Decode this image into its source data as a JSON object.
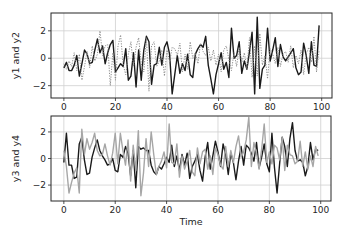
{
  "chart_data": [
    {
      "type": "line",
      "panel": "top",
      "title": "",
      "xlabel": "",
      "ylabel": "y1 and y2",
      "xlim": [
        -5,
        104
      ],
      "ylim": [
        -2.9,
        3.3
      ],
      "grid": true,
      "legend": null,
      "xticks": [
        0,
        20,
        40,
        60,
        80,
        100
      ],
      "yticks": [
        -2,
        0,
        2
      ],
      "xtick_labels": [
        "0",
        "20",
        "40",
        "60",
        "80",
        "100"
      ],
      "ytick_labels": [
        "−2",
        "0",
        "2"
      ],
      "series": [
        {
          "name": "y1",
          "style": "solid",
          "color": "#1a1a1a",
          "values": [
            -0.7,
            -0.3,
            -0.9,
            -0.9,
            -0.5,
            0.2,
            -1.3,
            -0.4,
            0.6,
            0.3,
            -0.4,
            -0.3,
            0.6,
            1.4,
            0.4,
            0.9,
            -0.4,
            0.4,
            1.0,
            1.3,
            -1.0,
            -0.7,
            -0.4,
            -0.6,
            0.7,
            -1.6,
            -1.3,
            0.4,
            -2.1,
            0.6,
            -1.6,
            0.6,
            1.6,
            1.2,
            -1.9,
            -0.5,
            -0.4,
            0.8,
            -0.5,
            0.8,
            1.2,
            0.3,
            -2.6,
            -1.2,
            0.2,
            -1.1,
            -0.4,
            -0.9,
            0.3,
            -1.2,
            -1.4,
            0.3,
            0.7,
            1.0,
            0.8,
            1.6,
            -0.5,
            -1.5,
            -2.6,
            -1.2,
            -0.4,
            0.4,
            -0.8,
            -0.3,
            -1.4,
            2.2,
            0.0,
            0.2,
            1.2,
            -1.1,
            -0.2,
            -0.8,
            0.5,
            1.9,
            -2.6,
            3.0,
            -2.2,
            -0.8,
            -0.5,
            2.2,
            -0.2,
            0.6,
            1.5,
            -0.6,
            1.0,
            0.1,
            -0.2,
            0.1,
            0.4,
            0.7,
            -0.7,
            -1.2,
            -1.0,
            1.1,
            0.2,
            -1.1,
            1.2,
            -0.5,
            -0.6,
            2.4
          ]
        },
        {
          "name": "y2",
          "style": "dotted",
          "color": "#8c8c8c",
          "values": [
            -0.4,
            -0.8,
            -0.2,
            -0.6,
            0.4,
            -0.9,
            0.3,
            -1.6,
            -0.6,
            0.5,
            -0.7,
            0.9,
            -0.2,
            0.3,
            2.0,
            0.2,
            0.9,
            1.0,
            -2.0,
            0.4,
            -1.6,
            0.9,
            1.7,
            -0.5,
            -1.2,
            0.3,
            1.2,
            -0.6,
            0.8,
            1.5,
            -0.4,
            -1.0,
            1.5,
            -2.4,
            0.9,
            1.2,
            -0.6,
            -0.2,
            0.6,
            -1.3,
            0.6,
            -0.3,
            0.8,
            0.7,
            0.2,
            1.1,
            -1.0,
            0.3,
            -0.8,
            1.2,
            0.0,
            0.4,
            -0.4,
            1.1,
            0.5,
            0.2,
            0.8,
            -0.2,
            0.6,
            -0.5,
            0.3,
            -1.0,
            0.6,
            0.9,
            -0.1,
            -0.9,
            0.4,
            -0.6,
            0.8,
            -0.3,
            0.4,
            -0.8,
            1.5,
            -1.4,
            0.9,
            -1.3,
            1.8,
            -0.5,
            0.2,
            -1.5,
            0.7,
            0.3,
            -0.4,
            0.8,
            -0.6,
            0.3,
            0.5,
            -0.3,
            0.9,
            -0.7,
            0.2,
            -0.4,
            0.6,
            -1.2,
            0.3,
            0.8,
            -0.3,
            1.6,
            -1.0,
            0.6
          ]
        }
      ]
    },
    {
      "type": "line",
      "panel": "bottom",
      "title": "",
      "xlabel": "Time",
      "ylabel": "y3 and y4",
      "xlim": [
        -5,
        104
      ],
      "ylim": [
        -3.2,
        3.2
      ],
      "grid": true,
      "legend": null,
      "xticks": [
        0,
        20,
        40,
        60,
        80,
        100
      ],
      "yticks": [
        -2,
        0,
        2
      ],
      "xtick_labels": [
        "0",
        "20",
        "40",
        "60",
        "80",
        "100"
      ],
      "ytick_labels": [
        "−2",
        "0",
        "2"
      ],
      "series": [
        {
          "name": "y3",
          "style": "solid",
          "color": "#1a1a1a",
          "values": [
            -0.3,
            1.9,
            -0.5,
            -0.5,
            -1.5,
            -1.4,
            1.1,
            1.6,
            -0.1,
            -1.2,
            -1.1,
            0.1,
            0.8,
            1.4,
            0.6,
            0.2,
            -0.1,
            -0.5,
            -0.4,
            0.0,
            -0.9,
            -1.0,
            0.3,
            0.1,
            0.9,
            0.4,
            -1.3,
            0.6,
            -2.2,
            0.9,
            0.7,
            0.8,
            0.6,
            0.6,
            -0.5,
            -1.0,
            -1.2,
            -0.6,
            -0.8,
            -0.4,
            0.1,
            -0.3,
            1.0,
            -0.6,
            0.2,
            -0.9,
            0.3,
            -0.5,
            0.4,
            -1.5,
            -0.6,
            -0.2,
            0.3,
            -0.9,
            -1.7,
            0.1,
            1.2,
            -0.8,
            0.2,
            1.3,
            0.5,
            -0.6,
            1.1,
            0.3,
            -1.2,
            0.4,
            -0.3,
            -1.6,
            -0.2,
            0.9,
            -0.5,
            1.0,
            0.8,
            0.4,
            -0.2,
            1.2,
            -0.7,
            0.1,
            1.1,
            -0.4,
            -1.0,
            1.9,
            -0.7,
            -2.6,
            -0.4,
            1.6,
            0.9,
            -0.6,
            1.5,
            2.7,
            0.6,
            -0.2,
            -0.1,
            -0.3,
            -1.3,
            -0.6,
            1.2,
            -0.1,
            0.7,
            0.6
          ]
        },
        {
          "name": "y4",
          "style": "solid",
          "color": "#a6a6a6",
          "values": [
            0.6,
            -0.6,
            -2.6,
            -1.8,
            -1.1,
            -0.7,
            -2.6,
            2.2,
            0.3,
            1.5,
            0.7,
            1.2,
            1.9,
            0.6,
            0.2,
            0.3,
            1.1,
            0.2,
            -0.5,
            0.4,
            1.9,
            -0.4,
            1.9,
            0.6,
            -0.5,
            1.4,
            -1.7,
            1.0,
            -0.9,
            2.1,
            -2.8,
            -1.1,
            1.5,
            -0.6,
            2.0,
            0.3,
            -1.2,
            -0.6,
            -0.2,
            0.5,
            -0.7,
            2.6,
            -0.3,
            -0.4,
            1.1,
            -1.4,
            0.2,
            -0.8,
            -0.2,
            0.6,
            -1.0,
            -1.3,
            0.8,
            -0.4,
            0.5,
            0.7,
            -0.8,
            0.2,
            -1.2,
            0.8,
            0.3,
            -0.5,
            -0.8,
            0.9,
            -0.6,
            0.6,
            -0.3,
            0.9,
            1.7,
            0.1,
            0.5,
            1.4,
            3.1,
            -0.6,
            1.2,
            0.4,
            -0.8,
            0.7,
            2.6,
            -0.3,
            0.5,
            -0.4,
            1.0,
            0.8,
            -0.1,
            1.6,
            -0.9,
            1.0,
            0.3,
            0.2,
            -0.4,
            -0.2,
            1.3,
            -0.6,
            0.5,
            -0.8,
            0.2,
            -0.6,
            0.9,
            0.2
          ]
        }
      ]
    }
  ]
}
